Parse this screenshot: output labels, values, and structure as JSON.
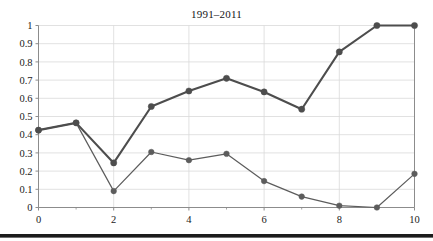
{
  "chart_data": {
    "type": "line",
    "title": "1991–2011",
    "xlabel": "",
    "ylabel": "",
    "x": [
      0,
      1,
      2,
      3,
      4,
      5,
      6,
      7,
      8,
      9,
      10
    ],
    "xlim": [
      0,
      10
    ],
    "ylim": [
      0,
      1
    ],
    "grid": true,
    "legend": "none",
    "x_tick_labels": [
      "0",
      "2",
      "4",
      "6",
      "8",
      "10"
    ],
    "x_tick_values": [
      0,
      2,
      4,
      6,
      8,
      10
    ],
    "x_minor_ticks": [
      1,
      3,
      5,
      7,
      9
    ],
    "y_tick_labels": [
      "0",
      "0.1",
      "0.2",
      "0.3",
      "0.4",
      "0.5",
      "0.6",
      "0.7",
      "0.8",
      "0.9",
      "1"
    ],
    "y_tick_values": [
      0,
      0.1,
      0.2,
      0.3,
      0.4,
      0.5,
      0.6,
      0.7,
      0.8,
      0.9,
      1
    ],
    "series": [
      {
        "name": "upper-series",
        "color": "#4d4d4d",
        "line_width": 2.1,
        "marker": "circle",
        "marker_size": 5,
        "values": [
          0.425,
          0.465,
          0.245,
          0.555,
          0.64,
          0.71,
          0.635,
          0.54,
          0.855,
          1.0,
          1.0
        ]
      },
      {
        "name": "lower-series",
        "color": "#5c5c5c",
        "line_width": 1.2,
        "marker": "circle",
        "marker_size": 4.4,
        "values": [
          0.425,
          0.465,
          0.09,
          0.305,
          0.26,
          0.295,
          0.145,
          0.06,
          0.01,
          0.0,
          0.185
        ]
      }
    ],
    "colors": {
      "grid": "#d9d9d9",
      "axis": "#8c8c8c",
      "text": "#1a1a1a",
      "background": "#ffffff",
      "rule": "#1c1c1c"
    }
  }
}
